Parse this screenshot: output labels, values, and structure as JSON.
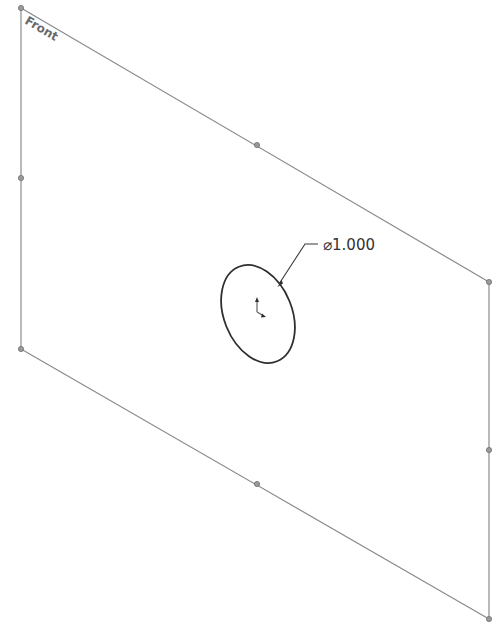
{
  "sketch": {
    "plane_label": "Front",
    "dimension": {
      "symbol": "⌀",
      "value": "1.000",
      "text": "⌀1.000"
    },
    "colors": {
      "plane_edge": "#8a8a8a",
      "vertex": "#9a9a9a",
      "circle": "#2f2f2f",
      "background": "#ffffff"
    }
  }
}
